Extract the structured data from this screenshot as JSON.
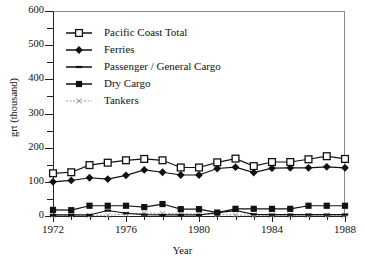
{
  "chart_data": {
    "type": "line",
    "title": "",
    "xlabel": "Year",
    "ylabel": "grt (thousand)",
    "xlim": [
      1972,
      1988
    ],
    "ylim": [
      0,
      600
    ],
    "yticks": [
      0,
      100,
      200,
      300,
      400,
      500,
      600
    ],
    "ytick_labels": [
      "0",
      "100",
      "200",
      "300",
      "400",
      "500",
      "600"
    ],
    "xticks": [
      1972,
      1976,
      1980,
      1984,
      1988
    ],
    "xtick_labels": [
      "1972",
      "1976",
      "1980",
      "1984",
      "1988"
    ],
    "minor_xticks_every": 1,
    "grid": false,
    "legend_position": "upper-left-inside",
    "x": [
      1972,
      1973,
      1974,
      1975,
      1976,
      1977,
      1978,
      1979,
      1980,
      1981,
      1982,
      1983,
      1984,
      1985,
      1986,
      1987,
      1988
    ],
    "series": [
      {
        "name": "Pacific Coast Total",
        "marker": "open-square",
        "color": "#111111",
        "values": [
          125,
          128,
          149,
          156,
          163,
          167,
          163,
          142,
          142,
          157,
          168,
          146,
          158,
          158,
          166,
          175,
          167
        ]
      },
      {
        "name": "Ferries",
        "marker": "filled-diamond",
        "color": "#111111",
        "values": [
          100,
          104,
          112,
          108,
          119,
          135,
          128,
          120,
          120,
          139,
          143,
          127,
          140,
          141,
          141,
          144,
          141
        ]
      },
      {
        "name": "Passenger / General Cargo",
        "marker": "dash",
        "color": "#111111",
        "values": [
          3,
          3,
          3,
          16,
          8,
          4,
          3,
          3,
          3,
          10,
          16,
          5,
          4,
          4,
          4,
          4,
          4
        ]
      },
      {
        "name": "Dry  Cargo",
        "marker": "filled-square",
        "color": "#111111",
        "values": [
          18,
          17,
          30,
          30,
          30,
          26,
          35,
          20,
          20,
          10,
          21,
          21,
          21,
          21,
          30,
          30,
          30
        ]
      },
      {
        "name": "Tankers",
        "marker": "x-dotted",
        "color": "#9a9a9a",
        "values": [
          2,
          2,
          2,
          2,
          6,
          8,
          8,
          7,
          6,
          4,
          3,
          2,
          2,
          2,
          2,
          2,
          2
        ]
      }
    ]
  },
  "axes": {
    "y_title": "grt (thousand)",
    "x_title": "Year"
  },
  "legend": {
    "items": [
      {
        "label": "Pacific Coast Total",
        "marker": "open-square"
      },
      {
        "label": "Ferries",
        "marker": "filled-diamond"
      },
      {
        "label": "Passenger / General Cargo",
        "marker": "dash"
      },
      {
        "label": "Dry  Cargo",
        "marker": "filled-square"
      },
      {
        "label": "Tankers",
        "marker": "x-dotted"
      }
    ]
  }
}
